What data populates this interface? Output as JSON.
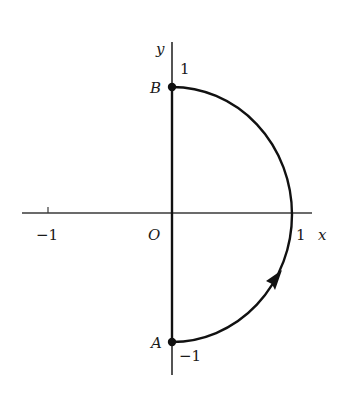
{
  "diagram": {
    "axes": {
      "x_label": "x",
      "y_label": "y",
      "origin_label": "O",
      "ticks": {
        "x_neg1": "−1",
        "x_pos1": "1",
        "y_pos1": "1",
        "y_neg1": "−1"
      }
    },
    "points": {
      "A": {
        "label": "A",
        "coords": [
          0,
          -1
        ]
      },
      "B": {
        "label": "B",
        "coords": [
          0,
          1
        ]
      }
    },
    "path": {
      "description": "Right half of unit circle from A(0,-1) counterclockwise to B(0,1), then segment BA along the y-axis",
      "direction": "counterclockwise",
      "arrow_position": "lower-right arc"
    },
    "colors": {
      "axis": "#3a3a3a",
      "curve": "#111111",
      "text": "#1a1a1a"
    }
  }
}
